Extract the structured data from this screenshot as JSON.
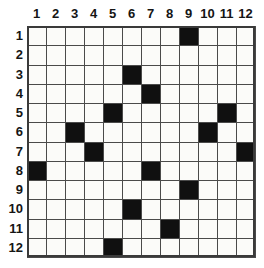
{
  "puzzle": {
    "title": "12x12 filled-cell grid",
    "rows": 12,
    "cols": 12,
    "column_headers": [
      "1",
      "2",
      "3",
      "4",
      "5",
      "6",
      "7",
      "8",
      "9",
      "10",
      "11",
      "12"
    ],
    "row_headers": [
      "1",
      "2",
      "3",
      "4",
      "5",
      "6",
      "7",
      "8",
      "9",
      "10",
      "11",
      "12"
    ],
    "colors": {
      "filled": "#101010",
      "empty": "#fbfbf9",
      "gridline": "#4a4a4a",
      "frame": "#3a3a3a",
      "label": "#151515",
      "background": "#ffffff"
    },
    "filled_cells": [
      {
        "row": 1,
        "col": 9
      },
      {
        "row": 3,
        "col": 6
      },
      {
        "row": 4,
        "col": 7
      },
      {
        "row": 5,
        "col": 5
      },
      {
        "row": 5,
        "col": 11
      },
      {
        "row": 6,
        "col": 3
      },
      {
        "row": 6,
        "col": 10
      },
      {
        "row": 7,
        "col": 4
      },
      {
        "row": 7,
        "col": 12
      },
      {
        "row": 8,
        "col": 1
      },
      {
        "row": 8,
        "col": 7
      },
      {
        "row": 9,
        "col": 9
      },
      {
        "row": 10,
        "col": 6
      },
      {
        "row": 11,
        "col": 8
      },
      {
        "row": 12,
        "col": 5
      }
    ],
    "filled_by_row": [
      {
        "row": 1,
        "cols": [
          9
        ]
      },
      {
        "row": 2,
        "cols": []
      },
      {
        "row": 3,
        "cols": [
          6
        ]
      },
      {
        "row": 4,
        "cols": [
          7
        ]
      },
      {
        "row": 5,
        "cols": [
          5,
          11
        ]
      },
      {
        "row": 6,
        "cols": [
          3,
          10
        ]
      },
      {
        "row": 7,
        "cols": [
          4,
          12
        ]
      },
      {
        "row": 8,
        "cols": [
          1,
          7
        ]
      },
      {
        "row": 9,
        "cols": [
          9
        ]
      },
      {
        "row": 10,
        "cols": [
          6
        ]
      },
      {
        "row": 11,
        "cols": [
          8
        ]
      },
      {
        "row": 12,
        "cols": [
          5
        ]
      }
    ],
    "filled_count": 15
  }
}
